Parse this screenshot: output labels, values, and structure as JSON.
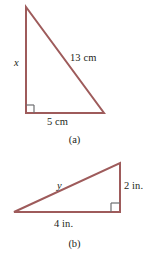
{
  "figures": [
    {
      "caption": "(a)",
      "shape": "right-triangle",
      "orientation": "right-angle-bottom-left",
      "vertices": {
        "apex": [
          26,
          7
        ],
        "right_angle": [
          26,
          113
        ],
        "base_end": [
          104,
          113
        ]
      },
      "labels": {
        "hypotenuse": "13 cm",
        "vertical_leg": "x",
        "horizontal_leg": "5 cm"
      }
    },
    {
      "caption": "(b)",
      "shape": "right-triangle",
      "orientation": "right-angle-bottom-right",
      "vertices": {
        "apex": [
          120,
          163
        ],
        "right_angle": [
          120,
          212
        ],
        "base_end": [
          14,
          212
        ]
      },
      "labels": {
        "hypotenuse": "y",
        "vertical_leg": "2 in.",
        "horizontal_leg": "4 in."
      }
    }
  ],
  "style": {
    "stroke_color": "#9e5b5b",
    "right_angle_color": "#6d6e71",
    "text_color": "#231f20",
    "background_color": "#ffffff"
  }
}
